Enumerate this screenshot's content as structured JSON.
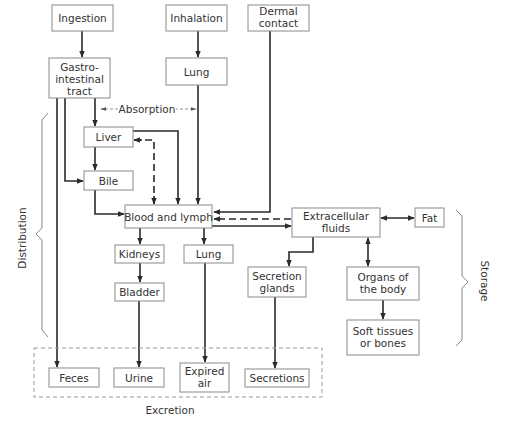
{
  "diagram": {
    "title": "",
    "nodes": {
      "ingestion": {
        "lines": [
          "Ingestion"
        ]
      },
      "inhalation": {
        "lines": [
          "Inhalation"
        ]
      },
      "dermal": {
        "lines": [
          "Dermal",
          "contact"
        ]
      },
      "gi": {
        "lines": [
          "Gastro-",
          "intestinal",
          "tract"
        ]
      },
      "lung_entry": {
        "lines": [
          "Lung"
        ]
      },
      "liver": {
        "lines": [
          "Liver"
        ]
      },
      "bile": {
        "lines": [
          "Bile"
        ]
      },
      "blood": {
        "lines": [
          "Blood and lymph"
        ]
      },
      "extracellular": {
        "lines": [
          "Extracellular",
          "fluids"
        ]
      },
      "fat": {
        "lines": [
          "Fat"
        ]
      },
      "kidneys": {
        "lines": [
          "Kidneys"
        ]
      },
      "lung_exit": {
        "lines": [
          "Lung"
        ]
      },
      "bladder": {
        "lines": [
          "Bladder"
        ]
      },
      "secretion_glands": {
        "lines": [
          "Secretion",
          "glands"
        ]
      },
      "organs": {
        "lines": [
          "Organs of",
          "the body"
        ]
      },
      "soft_tissues": {
        "lines": [
          "Soft tissues",
          "or bones"
        ]
      },
      "feces": {
        "lines": [
          "Feces"
        ]
      },
      "urine": {
        "lines": [
          "Urine"
        ]
      },
      "expired_air": {
        "lines": [
          "Expired",
          "air"
        ]
      },
      "secretions": {
        "lines": [
          "Secretions"
        ]
      }
    },
    "labels": {
      "absorption": "Absorption",
      "distribution": "Distribution",
      "storage": "Storage",
      "excretion": "Excretion"
    },
    "edges": [
      {
        "from": "Ingestion",
        "to": "Gastro-intestinal tract",
        "style": "solid"
      },
      {
        "from": "Inhalation",
        "to": "Lung",
        "style": "solid"
      },
      {
        "from": "Gastro-intestinal tract",
        "to": "Liver",
        "style": "solid"
      },
      {
        "from": "Gastro-intestinal tract",
        "to": "Bile",
        "style": "solid"
      },
      {
        "from": "Gastro-intestinal tract",
        "to": "Feces",
        "style": "solid"
      },
      {
        "from": "Liver",
        "to": "Bile",
        "style": "solid"
      },
      {
        "from": "Liver",
        "to": "Blood and lymph",
        "style": "solid"
      },
      {
        "from": "Blood and lymph",
        "to": "Liver",
        "style": "dashed"
      },
      {
        "from": "Bile",
        "to": "Blood and lymph",
        "style": "solid"
      },
      {
        "from": "Lung",
        "to": "Blood and lymph",
        "style": "solid"
      },
      {
        "from": "Dermal contact",
        "to": "Blood and lymph",
        "style": "solid"
      },
      {
        "from": "Blood and lymph",
        "to": "Extracellular fluids",
        "style": "solid"
      },
      {
        "from": "Extracellular fluids",
        "to": "Blood and lymph",
        "style": "dashed"
      },
      {
        "from": "Extracellular fluids",
        "to": "Fat",
        "style": "bidirectional"
      },
      {
        "from": "Extracellular fluids",
        "to": "Organs of the body",
        "style": "bidirectional"
      },
      {
        "from": "Extracellular fluids",
        "to": "Secretion glands",
        "style": "solid"
      },
      {
        "from": "Organs of the body",
        "to": "Soft tissues or bones",
        "style": "solid"
      },
      {
        "from": "Blood and lymph",
        "to": "Kidneys",
        "style": "solid"
      },
      {
        "from": "Blood and lymph",
        "to": "Lung",
        "style": "solid"
      },
      {
        "from": "Kidneys",
        "to": "Bladder",
        "style": "solid"
      },
      {
        "from": "Bladder",
        "to": "Urine",
        "style": "solid"
      },
      {
        "from": "Lung",
        "to": "Expired air",
        "style": "solid"
      },
      {
        "from": "Secretion glands",
        "to": "Secretions",
        "style": "solid"
      }
    ]
  }
}
